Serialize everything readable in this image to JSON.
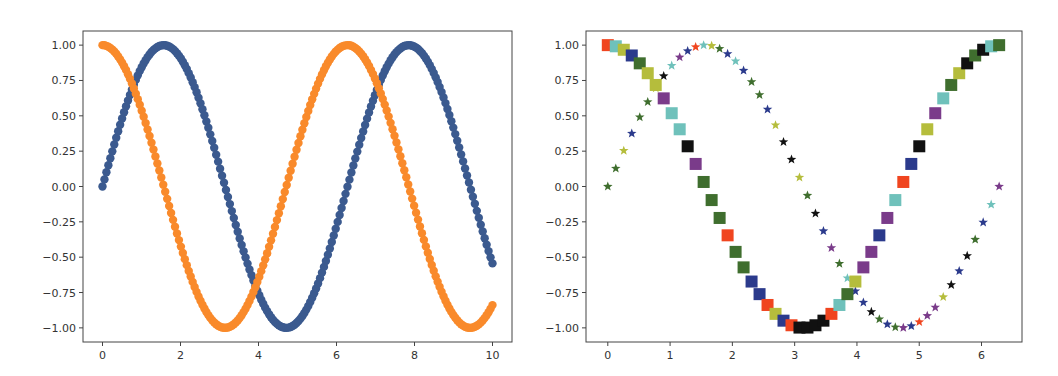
{
  "chart_data": [
    {
      "type": "scatter",
      "title": "",
      "xlabel": "",
      "ylabel": "",
      "xlim": [
        -0.5,
        10.5
      ],
      "ylim": [
        -1.1,
        1.1
      ],
      "grid": false,
      "xticks": [
        "0",
        "2",
        "4",
        "6",
        "8",
        "10"
      ],
      "yticks": [
        "1.00",
        "0.75",
        "0.50",
        "0.25",
        "0.00",
        "−0.25",
        "−0.50",
        "−0.75",
        "−1.00"
      ],
      "series": [
        {
          "name": "sin(x)",
          "function": "sin",
          "x_range": [
            0,
            10
          ],
          "n_points": 200,
          "color": "#3b5a8f",
          "marker": "circle"
        },
        {
          "name": "cos(x)",
          "function": "cos",
          "x_range": [
            0,
            10
          ],
          "n_points": 200,
          "color": "#f98a2b",
          "marker": "circle"
        }
      ]
    },
    {
      "type": "scatter",
      "title": "",
      "xlabel": "",
      "ylabel": "",
      "xlim": [
        -0.35,
        6.65
      ],
      "ylim": [
        -1.1,
        1.1
      ],
      "grid": false,
      "xticks": [
        "0",
        "1",
        "2",
        "3",
        "4",
        "5",
        "6"
      ],
      "yticks": [
        "1.00",
        "0.75",
        "0.50",
        "0.25",
        "0.00",
        "−0.25",
        "−0.50",
        "−0.75",
        "−1.00"
      ],
      "series": [
        {
          "name": "sin(x)",
          "function": "sin",
          "x_range": [
            0,
            6.2832
          ],
          "n_points": 50,
          "marker": "star"
        },
        {
          "name": "cos(x)",
          "function": "cos",
          "x_range": [
            0,
            6.2832
          ],
          "n_points": 50,
          "marker": "square"
        }
      ],
      "marker_colors": [
        "#b5bd3c",
        "#2b3a8c",
        "#7a3b8a",
        "#3f6e2e",
        "#6fc1bb",
        "#f0451f",
        "#111111"
      ]
    }
  ]
}
